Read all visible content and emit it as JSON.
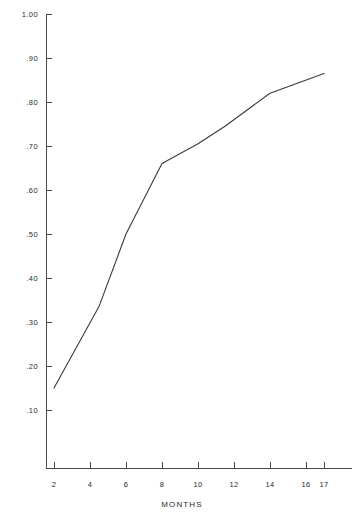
{
  "chart_data": {
    "type": "line",
    "title": "",
    "xlabel": "MONTHS",
    "ylabel": "",
    "xlim": [
      0,
      18
    ],
    "ylim": [
      0,
      1.0
    ],
    "grid": false,
    "legend": null,
    "axis_color": "#4a4a4a",
    "line_color": "#3a3a3a",
    "x_ticks": [
      2,
      4,
      6,
      8,
      10,
      12,
      14,
      16,
      17
    ],
    "x_tick_labels": [
      "2",
      "4",
      "6",
      "8",
      "10",
      "12",
      "14",
      "16",
      "17"
    ],
    "y_ticks": [
      0.1,
      0.2,
      0.3,
      0.4,
      0.5,
      0.6,
      0.7,
      0.8,
      0.9,
      1.0
    ],
    "y_tick_labels": [
      ".10",
      ".20",
      ".30",
      ".40",
      ".50",
      ".60",
      ".70",
      ".80",
      ".90",
      "1.00"
    ],
    "x": [
      2,
      4.5,
      6,
      8,
      10,
      11.5,
      14,
      17
    ],
    "y": [
      0.15,
      0.335,
      0.5,
      0.66,
      0.705,
      0.745,
      0.82,
      0.865
    ],
    "series": [
      {
        "name": "series-1",
        "points": [
          {
            "x": 2,
            "y": 0.15
          },
          {
            "x": 4.5,
            "y": 0.335
          },
          {
            "x": 6,
            "y": 0.5
          },
          {
            "x": 8,
            "y": 0.66
          },
          {
            "x": 10,
            "y": 0.705
          },
          {
            "x": 11.5,
            "y": 0.745
          },
          {
            "x": 14,
            "y": 0.82
          },
          {
            "x": 17,
            "y": 0.865
          }
        ]
      }
    ]
  }
}
